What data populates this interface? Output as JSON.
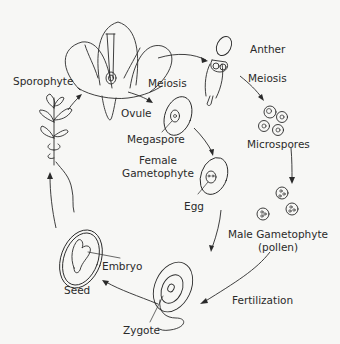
{
  "diagram": {
    "labels": {
      "sporophyte": "Sporophyte",
      "meiosis_female": "Meiosis",
      "anther": "Anther",
      "meiosis_male": "Meiosis",
      "ovule": "Ovule",
      "megaspore": "Megaspore",
      "female_gametophyte_line1": "Female",
      "female_gametophyte_line2": "Gametophyte",
      "microspores": "Microspores",
      "egg": "Egg",
      "male_gametophyte_line1": "Male Gametophyte",
      "male_gametophyte_line2": "(pollen)",
      "embryo": "Embryo",
      "seed": "Seed",
      "fertilization": "Fertilization",
      "zygote": "Zygote"
    },
    "stages": [
      "Sporophyte",
      "Meiosis",
      "Ovule",
      "Megaspore",
      "Female Gametophyte",
      "Egg",
      "Anther",
      "Microspores",
      "Male Gametophyte (pollen)",
      "Fertilization",
      "Zygote",
      "Embryo",
      "Seed"
    ],
    "colors": {
      "ink": "#2a2a2a",
      "background": "#f7f7f5"
    }
  }
}
